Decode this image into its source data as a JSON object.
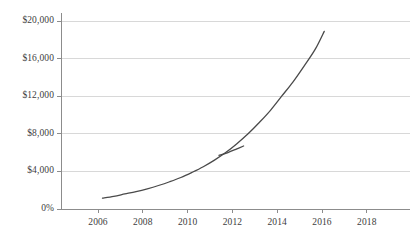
{
  "chart_data": {
    "type": "line",
    "title": "",
    "subtitle": "",
    "xlabel": "",
    "ylabel": "",
    "grid": "horizontal",
    "legend": "none",
    "xlim": [
      2005,
      2019
    ],
    "ylim": [
      0,
      20000
    ],
    "x_tick_labels": [
      "2006",
      "2008",
      "2010",
      "2012",
      "2014",
      "2016",
      "2018"
    ],
    "x_tick_values": [
      2006,
      2008,
      2010,
      2012,
      2014,
      2016,
      2018
    ],
    "y_tick_labels": [
      "$20,000",
      "$16,000",
      "$12,000",
      "$8,000",
      "$4,000",
      "0%"
    ],
    "y_tick_values": [
      20000,
      16000,
      12000,
      8000,
      4000,
      0
    ],
    "axis_color": "#8c8c8c",
    "grid_color": "#d8d8d8",
    "tick_label_color": "#3d3d3d",
    "series": [
      {
        "name": "main-curve",
        "color": "#4a4a4a",
        "x": [
          2006.2,
          2006.7,
          2007.2,
          2007.7,
          2008.2,
          2008.7,
          2009.2,
          2009.7,
          2010.2,
          2010.7,
          2011.2,
          2011.7,
          2012.2,
          2012.7,
          2013.2,
          2013.7,
          2014.2,
          2014.7,
          2015.2,
          2015.7,
          2016.1
        ],
        "y": [
          1150,
          1350,
          1600,
          1850,
          2150,
          2500,
          2900,
          3350,
          3900,
          4500,
          5200,
          6000,
          6950,
          8000,
          9200,
          10500,
          12000,
          13500,
          15200,
          17000,
          18900
        ]
      },
      {
        "name": "secondary-segment",
        "color": "#4a4a4a",
        "x": [
          2011.4,
          2011.8,
          2012.2,
          2012.5
        ],
        "y": [
          5700,
          6000,
          6400,
          6700
        ]
      }
    ]
  }
}
